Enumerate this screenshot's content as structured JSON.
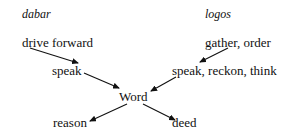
{
  "columns": {
    "left_heading": "dabar",
    "right_heading": "logos"
  },
  "nodes": {
    "drive_forward": "drive forward",
    "gather_order": "gather, order",
    "speak_left": "speak",
    "speak_reckon_think": "speak, reckon, think",
    "word": "Word",
    "reason": "reason",
    "deed": "deed"
  },
  "edges": [
    {
      "from": "drive forward",
      "to": "speak"
    },
    {
      "from": "gather, order",
      "to": "speak, reckon, think"
    },
    {
      "from": "speak",
      "to": "Word"
    },
    {
      "from": "speak, reckon, think",
      "to": "Word"
    },
    {
      "from": "Word",
      "to": "reason"
    },
    {
      "from": "Word",
      "to": "deed"
    }
  ]
}
